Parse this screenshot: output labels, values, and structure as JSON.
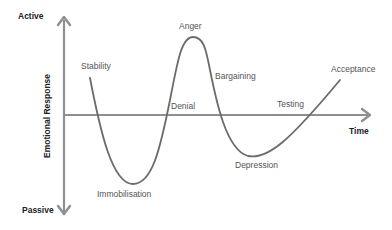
{
  "diagram": {
    "type": "emotional-response-change-curve",
    "axes": {
      "y_label": "Emotional Response",
      "y_top": "Active",
      "y_bottom": "Passive",
      "x_label": "Time"
    },
    "stages": [
      {
        "label": "Stability"
      },
      {
        "label": "Immobilisation"
      },
      {
        "label": "Denial"
      },
      {
        "label": "Anger"
      },
      {
        "label": "Bargaining"
      },
      {
        "label": "Depression"
      },
      {
        "label": "Testing"
      },
      {
        "label": "Acceptance"
      }
    ],
    "colors": {
      "axis": "#8a8a8a",
      "curve": "#6b6b6b",
      "label": "#555555",
      "axis_label": "#222222",
      "background": "#ffffff"
    }
  }
}
